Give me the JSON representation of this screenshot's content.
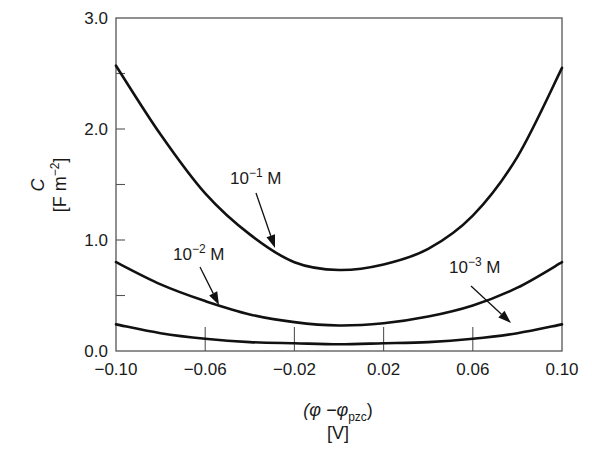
{
  "chart_data": {
    "type": "line",
    "title": "",
    "xlabel": "(φ − φ_pzc) [V]",
    "ylabel": "C [F m^-2]",
    "xlim": [
      -0.1,
      0.1
    ],
    "ylim": [
      0.0,
      3.0
    ],
    "grid": false,
    "legend": "none (curves labeled directly with arrows)",
    "x_ticks": [
      -0.1,
      -0.06,
      -0.02,
      0.02,
      0.06,
      0.1
    ],
    "x_tick_labels": [
      "−0.10",
      "−0.06",
      "−0.02",
      "0.02",
      "0.06",
      "0.10"
    ],
    "y_ticks": [
      0.0,
      1.0,
      2.0,
      3.0
    ],
    "y_tick_labels": [
      "0.0",
      "1.0",
      "2.0",
      "3.0"
    ],
    "y_minor_ticks": [
      0.5,
      1.5,
      2.5
    ],
    "x": [
      -0.1,
      -0.08,
      -0.06,
      -0.04,
      -0.02,
      0.0,
      0.02,
      0.04,
      0.06,
      0.08,
      0.1
    ],
    "series": [
      {
        "name": "10^-1 M",
        "values": [
          2.57,
          1.95,
          1.42,
          1.05,
          0.8,
          0.73,
          0.78,
          0.92,
          1.22,
          1.75,
          2.55
        ]
      },
      {
        "name": "10^-2 M",
        "values": [
          0.8,
          0.6,
          0.45,
          0.33,
          0.26,
          0.23,
          0.25,
          0.31,
          0.41,
          0.57,
          0.8
        ]
      },
      {
        "name": "10^-3 M",
        "values": [
          0.24,
          0.16,
          0.11,
          0.08,
          0.07,
          0.06,
          0.07,
          0.08,
          0.11,
          0.16,
          0.24
        ]
      }
    ],
    "annotations": [
      {
        "text": "10",
        "exp": "−1",
        "unit": " M",
        "series": "10^-1 M",
        "text_pos": [
          230,
          184
        ],
        "arrow_from": [
          256,
          193
        ],
        "arrow_to": [
          275,
          248
        ]
      },
      {
        "text": "10",
        "exp": "−2",
        "unit": " M",
        "series": "10^-2 M",
        "text_pos": [
          173,
          260
        ],
        "arrow_from": [
          200,
          267
        ],
        "arrow_to": [
          219,
          305
        ]
      },
      {
        "text": "10",
        "exp": "−3",
        "unit": " M",
        "series": "10^-3 M",
        "text_pos": [
          449,
          273
        ],
        "arrow_from": [
          471,
          286
        ],
        "arrow_to": [
          511,
          323
        ]
      }
    ]
  },
  "labels": {
    "y_title_line1": "C",
    "y_title_line2": "[F m",
    "y_title_exp": "−2",
    "y_title_close": "]",
    "x_title_line1_a": "(φ −φ",
    "x_title_sub": "pzc",
    "x_title_line1_b": ")",
    "x_title_line2": "[V]"
  },
  "colors": {
    "curve": "#111111",
    "frame": "#555555",
    "text": "#1a1a1a"
  }
}
